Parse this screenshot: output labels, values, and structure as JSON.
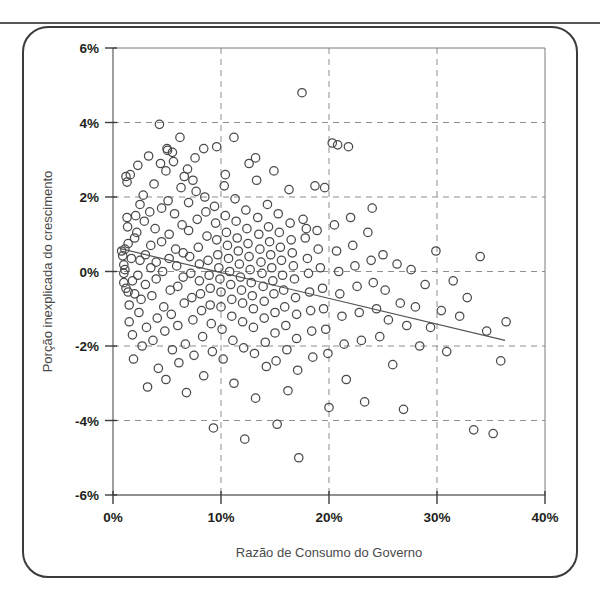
{
  "figure": {
    "type_label": "scatter-plot",
    "frame_color": "#3b3b3b",
    "marker_color": "#4a4a4a",
    "trendline_color": "#555555",
    "grid_color": "#8d8d8d"
  },
  "chart_data": {
    "type": "scatter",
    "title": "",
    "xlabel": "Razão de Consumo do Governo",
    "ylabel": "Porção inexplicada do crescimento",
    "xlim": [
      0,
      40
    ],
    "ylim": [
      -6,
      6
    ],
    "xticks": [
      "0%",
      "10%",
      "20%",
      "30%",
      "40%"
    ],
    "xtick_values": [
      0,
      10,
      20,
      30,
      40
    ],
    "yticks": [
      "6%",
      "4%",
      "2%",
      "0%",
      "-2%",
      "-4%",
      "-6%"
    ],
    "ytick_values": [
      6,
      4,
      2,
      0,
      -2,
      -4,
      -6
    ],
    "grid": "dashed gridlines at every tick, both axes",
    "legend": "none",
    "units": "percent",
    "trendline": {
      "label": "linear fit",
      "x": [
        0.6,
        36.3
      ],
      "y": [
        0.62,
        -1.85
      ],
      "slope_per_pct": -0.069,
      "intercept": 0.66
    },
    "series": [
      {
        "name": "Países",
        "n_points": 265,
        "points": [
          [
            0.8,
            0.55
          ],
          [
            0.9,
            0.42
          ],
          [
            1.0,
            0.18
          ],
          [
            1.0,
            -0.05
          ],
          [
            1.0,
            -0.3
          ],
          [
            1.1,
            0.6
          ],
          [
            1.1,
            0.05
          ],
          [
            1.2,
            -0.45
          ],
          [
            1.2,
            2.55
          ],
          [
            1.3,
            2.4
          ],
          [
            1.3,
            1.45
          ],
          [
            1.35,
            1.2
          ],
          [
            1.4,
            0.75
          ],
          [
            1.4,
            -0.55
          ],
          [
            1.5,
            -0.9
          ],
          [
            1.5,
            -1.35
          ],
          [
            1.6,
            2.6
          ],
          [
            1.7,
            0.35
          ],
          [
            1.8,
            -0.25
          ],
          [
            1.8,
            -1.7
          ],
          [
            1.9,
            -2.35
          ],
          [
            2.0,
            0.9
          ],
          [
            2.0,
            -0.6
          ],
          [
            2.1,
            1.5
          ],
          [
            2.2,
            1.05
          ],
          [
            2.3,
            2.85
          ],
          [
            2.3,
            -0.1
          ],
          [
            2.4,
            -1.1
          ],
          [
            2.5,
            1.8
          ],
          [
            2.5,
            0.3
          ],
          [
            2.6,
            -0.75
          ],
          [
            2.7,
            -2.0
          ],
          [
            2.8,
            2.05
          ],
          [
            2.9,
            1.35
          ],
          [
            3.0,
            0.45
          ],
          [
            3.0,
            -0.35
          ],
          [
            3.1,
            -1.5
          ],
          [
            3.2,
            -3.1
          ],
          [
            3.3,
            3.1
          ],
          [
            3.4,
            1.6
          ],
          [
            3.5,
            0.7
          ],
          [
            3.5,
            0.1
          ],
          [
            3.6,
            -0.65
          ],
          [
            3.7,
            -1.85
          ],
          [
            3.8,
            2.35
          ],
          [
            3.9,
            1.15
          ],
          [
            4.0,
            0.25
          ],
          [
            4.0,
            -0.2
          ],
          [
            4.1,
            -1.25
          ],
          [
            4.2,
            -2.6
          ],
          [
            4.3,
            3.95
          ],
          [
            4.4,
            2.9
          ],
          [
            4.5,
            1.7
          ],
          [
            4.5,
            0.8
          ],
          [
            4.6,
            0.0
          ],
          [
            4.7,
            -0.95
          ],
          [
            4.8,
            -1.6
          ],
          [
            4.9,
            -2.9
          ],
          [
            5.0,
            3.3
          ],
          [
            5.05,
            3.25
          ],
          [
            5.1,
            1.9
          ],
          [
            5.2,
            1.0
          ],
          [
            5.2,
            0.35
          ],
          [
            5.3,
            -0.5
          ],
          [
            5.4,
            -1.15
          ],
          [
            5.5,
            -2.1
          ],
          [
            5.6,
            2.95
          ],
          [
            5.7,
            1.55
          ],
          [
            5.8,
            0.6
          ],
          [
            5.9,
            0.15
          ],
          [
            6.0,
            -0.4
          ],
          [
            6.0,
            -1.45
          ],
          [
            6.1,
            -2.45
          ],
          [
            6.2,
            3.6
          ],
          [
            6.3,
            2.25
          ],
          [
            6.4,
            1.25
          ],
          [
            6.5,
            0.5
          ],
          [
            6.5,
            -0.15
          ],
          [
            6.6,
            -0.85
          ],
          [
            6.7,
            -1.95
          ],
          [
            6.8,
            -3.25
          ],
          [
            6.9,
            2.75
          ],
          [
            7.0,
            1.85
          ],
          [
            7.0,
            1.1
          ],
          [
            7.1,
            0.4
          ],
          [
            7.2,
            -0.05
          ],
          [
            7.3,
            -0.7
          ],
          [
            7.4,
            -1.3
          ],
          [
            7.5,
            -2.25
          ],
          [
            7.6,
            3.05
          ],
          [
            7.7,
            2.15
          ],
          [
            7.8,
            1.4
          ],
          [
            7.9,
            0.65
          ],
          [
            8.0,
            0.2
          ],
          [
            8.0,
            -0.25
          ],
          [
            8.1,
            -0.6
          ],
          [
            8.2,
            -1.05
          ],
          [
            8.3,
            -1.75
          ],
          [
            8.4,
            -2.8
          ],
          [
            8.5,
            2.0
          ],
          [
            8.6,
            1.6
          ],
          [
            8.7,
            0.95
          ],
          [
            8.8,
            0.3
          ],
          [
            8.9,
            -0.1
          ],
          [
            9.0,
            -0.45
          ],
          [
            9.0,
            -0.9
          ],
          [
            9.1,
            -1.4
          ],
          [
            9.2,
            -2.15
          ],
          [
            9.3,
            -4.2
          ],
          [
            9.4,
            1.75
          ],
          [
            9.5,
            1.3
          ],
          [
            9.6,
            0.85
          ],
          [
            9.7,
            0.45
          ],
          [
            9.8,
            0.1
          ],
          [
            9.9,
            -0.2
          ],
          [
            10.0,
            -0.55
          ],
          [
            10.0,
            -0.95
          ],
          [
            10.1,
            -1.55
          ],
          [
            10.2,
            -2.35
          ],
          [
            10.3,
            2.3
          ],
          [
            10.4,
            1.5
          ],
          [
            10.5,
            1.05
          ],
          [
            10.6,
            0.7
          ],
          [
            10.7,
            0.35
          ],
          [
            10.8,
            0.0
          ],
          [
            10.9,
            -0.35
          ],
          [
            11.0,
            -0.75
          ],
          [
            11.0,
            -1.2
          ],
          [
            11.1,
            -1.85
          ],
          [
            11.2,
            -3.0
          ],
          [
            11.3,
            1.95
          ],
          [
            11.4,
            1.35
          ],
          [
            11.5,
            0.9
          ],
          [
            11.6,
            0.55
          ],
          [
            11.7,
            0.2
          ],
          [
            11.8,
            -0.15
          ],
          [
            11.9,
            -0.5
          ],
          [
            12.0,
            -0.85
          ],
          [
            12.0,
            -1.35
          ],
          [
            12.1,
            -2.05
          ],
          [
            12.2,
            -4.5
          ],
          [
            12.3,
            1.65
          ],
          [
            12.4,
            1.15
          ],
          [
            12.5,
            0.75
          ],
          [
            12.6,
            0.4
          ],
          [
            12.7,
            0.05
          ],
          [
            12.8,
            -0.3
          ],
          [
            12.9,
            -0.65
          ],
          [
            13.0,
            -1.0
          ],
          [
            13.0,
            -1.5
          ],
          [
            13.1,
            -2.2
          ],
          [
            13.2,
            -3.4
          ],
          [
            13.3,
            2.45
          ],
          [
            13.4,
            1.45
          ],
          [
            13.5,
            1.0
          ],
          [
            13.6,
            0.6
          ],
          [
            13.7,
            0.25
          ],
          [
            13.8,
            -0.05
          ],
          [
            13.9,
            -0.4
          ],
          [
            14.0,
            -0.8
          ],
          [
            14.0,
            -1.25
          ],
          [
            14.1,
            -1.9
          ],
          [
            14.2,
            -2.55
          ],
          [
            14.3,
            1.8
          ],
          [
            14.4,
            1.2
          ],
          [
            14.5,
            0.8
          ],
          [
            14.6,
            0.45
          ],
          [
            14.7,
            0.1
          ],
          [
            14.8,
            -0.25
          ],
          [
            14.9,
            -0.6
          ],
          [
            15.0,
            -1.1
          ],
          [
            15.0,
            -1.65
          ],
          [
            15.1,
            -2.4
          ],
          [
            15.2,
            -4.1
          ],
          [
            15.3,
            1.55
          ],
          [
            15.4,
            1.05
          ],
          [
            15.5,
            0.65
          ],
          [
            15.6,
            0.3
          ],
          [
            15.7,
            -0.1
          ],
          [
            15.8,
            -0.5
          ],
          [
            15.9,
            -0.95
          ],
          [
            16.0,
            -1.45
          ],
          [
            16.1,
            -2.1
          ],
          [
            16.2,
            -3.2
          ],
          [
            16.3,
            2.2
          ],
          [
            16.4,
            1.3
          ],
          [
            16.5,
            0.85
          ],
          [
            16.6,
            0.5
          ],
          [
            16.7,
            0.15
          ],
          [
            16.8,
            -0.2
          ],
          [
            16.9,
            -0.7
          ],
          [
            17.0,
            -1.15
          ],
          [
            17.0,
            -1.8
          ],
          [
            17.1,
            -2.65
          ],
          [
            17.2,
            -5.0
          ],
          [
            17.5,
            4.8
          ],
          [
            17.6,
            1.4
          ],
          [
            17.8,
            0.9
          ],
          [
            18.0,
            0.35
          ],
          [
            18.1,
            -0.05
          ],
          [
            18.2,
            -0.55
          ],
          [
            18.3,
            -1.05
          ],
          [
            18.4,
            -1.6
          ],
          [
            18.5,
            -2.3
          ],
          [
            18.7,
            2.3
          ],
          [
            18.9,
            1.1
          ],
          [
            19.0,
            0.6
          ],
          [
            19.2,
            0.1
          ],
          [
            19.4,
            -0.45
          ],
          [
            19.5,
            -1.0
          ],
          [
            19.7,
            -1.55
          ],
          [
            19.9,
            -2.2
          ],
          [
            20.0,
            -3.65
          ],
          [
            20.3,
            3.45
          ],
          [
            20.5,
            1.25
          ],
          [
            20.7,
            0.55
          ],
          [
            20.9,
            0.0
          ],
          [
            21.0,
            -0.6
          ],
          [
            21.2,
            -1.2
          ],
          [
            21.4,
            -1.95
          ],
          [
            21.6,
            -2.9
          ],
          [
            21.8,
            3.35
          ],
          [
            22.0,
            1.45
          ],
          [
            22.2,
            0.7
          ],
          [
            22.4,
            0.15
          ],
          [
            22.6,
            -0.4
          ],
          [
            22.8,
            -1.1
          ],
          [
            23.0,
            -1.85
          ],
          [
            23.3,
            -3.5
          ],
          [
            23.6,
            1.05
          ],
          [
            23.9,
            0.3
          ],
          [
            24.1,
            -0.3
          ],
          [
            24.4,
            -1.0
          ],
          [
            24.7,
            -1.75
          ],
          [
            25.0,
            0.45
          ],
          [
            25.2,
            -0.5
          ],
          [
            25.5,
            -1.3
          ],
          [
            25.9,
            -2.5
          ],
          [
            26.3,
            0.2
          ],
          [
            26.6,
            -0.85
          ],
          [
            26.9,
            -3.7
          ],
          [
            27.2,
            -1.45
          ],
          [
            27.6,
            0.05
          ],
          [
            28.0,
            -0.95
          ],
          [
            28.4,
            -2.0
          ],
          [
            28.9,
            -0.35
          ],
          [
            29.4,
            -1.5
          ],
          [
            29.9,
            0.55
          ],
          [
            30.4,
            -1.05
          ],
          [
            30.9,
            -2.15
          ],
          [
            31.5,
            -0.25
          ],
          [
            32.1,
            -1.2
          ],
          [
            32.8,
            -0.7
          ],
          [
            33.4,
            -4.25
          ],
          [
            34.0,
            0.4
          ],
          [
            34.6,
            -1.6
          ],
          [
            35.2,
            -4.35
          ],
          [
            35.9,
            -2.4
          ],
          [
            36.4,
            -1.35
          ],
          [
            24.0,
            1.7
          ],
          [
            20.8,
            3.4
          ],
          [
            14.9,
            2.7
          ],
          [
            12.6,
            2.9
          ],
          [
            9.6,
            3.35
          ],
          [
            8.4,
            3.3
          ],
          [
            6.6,
            2.55
          ],
          [
            5.5,
            3.2
          ],
          [
            19.6,
            2.25
          ],
          [
            17.9,
            1.15
          ],
          [
            13.2,
            3.05
          ],
          [
            11.2,
            3.6
          ],
          [
            10.4,
            2.6
          ],
          [
            7.4,
            2.45
          ],
          [
            4.9,
            2.7
          ]
        ]
      }
    ]
  },
  "axes": {
    "x_title": "Razão de Consumo do Governo",
    "y_title": "Porção inexplicada do crescimento"
  }
}
